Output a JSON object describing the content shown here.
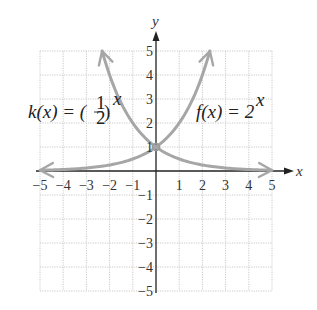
{
  "chart_data": {
    "type": "line",
    "title": "",
    "xlabel": "x",
    "ylabel": "y",
    "xlim": [
      -5,
      5
    ],
    "ylim": [
      -5,
      5
    ],
    "grid": true,
    "x_ticks": [
      -5,
      -4,
      -3,
      -2,
      -1,
      1,
      2,
      3,
      4,
      5
    ],
    "y_ticks": [
      5,
      4,
      3,
      2,
      1,
      -1,
      -2,
      -3,
      -4,
      -5
    ],
    "series": [
      {
        "name": "f(x) = 2^x",
        "label_text": "f(x) = 2",
        "label_exp": "x",
        "formula": "2^x",
        "color": "#a6a6a6",
        "x": [
          -5,
          -4,
          -3,
          -2,
          -1,
          0,
          1,
          2,
          2.32
        ],
        "values": [
          0.03125,
          0.0625,
          0.125,
          0.25,
          0.5,
          1,
          2,
          4,
          5
        ]
      },
      {
        "name": "k(x) = (1/2)^x",
        "label_text": "k(x) = (",
        "label_frac_num": "1",
        "label_frac_den": "2",
        "label_close": ")",
        "label_exp": "x",
        "formula": "(1/2)^x",
        "color": "#a6a6a6",
        "x": [
          -2.32,
          -2,
          -1,
          0,
          1,
          2,
          3,
          4,
          5
        ],
        "values": [
          5,
          4,
          2,
          1,
          0.5,
          0.25,
          0.125,
          0.0625,
          0.03125
        ]
      }
    ],
    "legend": "inline labels",
    "intersection": {
      "x": 0,
      "y": 1
    }
  },
  "axes": {
    "x_name": "x",
    "y_name": "y",
    "x_tick_labels": [
      "−5",
      "−4",
      "−3",
      "−2",
      "−1",
      "1",
      "2",
      "3",
      "4",
      "5"
    ],
    "y_tick_labels": [
      "5",
      "4",
      "3",
      "2",
      "1",
      "−1",
      "−2",
      "−3",
      "−4",
      "−5"
    ]
  },
  "labels": {
    "f": {
      "name": "f(x) = 2",
      "exp": "x"
    },
    "k": {
      "name": "k(x) = (",
      "num": "1",
      "den": "2",
      "close": ")",
      "exp": "x"
    }
  }
}
